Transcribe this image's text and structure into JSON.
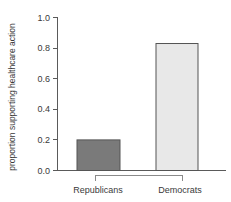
{
  "chart_data": {
    "type": "bar",
    "title": "",
    "subtitle": "",
    "xlabel": "",
    "ylabel": "proportion supporting healthcare action",
    "categories": [
      "Republicans",
      "Democrats"
    ],
    "values": [
      0.2,
      0.83
    ],
    "ylim": [
      0.0,
      1.0
    ],
    "y_ticks": [
      "0.0",
      "0.2",
      "0.4",
      "0.6",
      "0.8",
      "1.0"
    ],
    "y_tick_values": [
      0.0,
      0.2,
      0.4,
      0.6,
      0.8,
      1.0
    ],
    "grid": false,
    "legend": "none",
    "bar_colors": [
      "#7a7a7a",
      "#e8e8e8"
    ],
    "bar_border_color": "#555555",
    "axis_color": "#5a5a5a",
    "bracket_color": "#8a8a8a"
  },
  "axis": {
    "y_title": "proportion supporting healthcare action",
    "ticks": [
      {
        "label": "1.0",
        "value": 1.0
      },
      {
        "label": "0.8",
        "value": 0.8
      },
      {
        "label": "0.6",
        "value": 0.6
      },
      {
        "label": "0.4",
        "value": 0.4
      },
      {
        "label": "0.2",
        "value": 0.2
      },
      {
        "label": "0.0",
        "value": 0.0
      }
    ]
  },
  "bars": [
    {
      "label": "Republicans",
      "value": 0.2,
      "color": "#7a7a7a"
    },
    {
      "label": "Democrats",
      "value": 0.83,
      "color": "#e8e8e8"
    }
  ]
}
